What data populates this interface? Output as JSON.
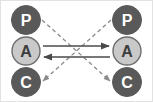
{
  "diagram": {
    "type": "node-link-diagram",
    "background_color": "#ffffff",
    "border_color": "#e2e2e2",
    "nodes": [
      {
        "id": "left-p",
        "label": "P",
        "column": "left",
        "row": "top",
        "cx": 26,
        "cy": 20,
        "r": 15,
        "fill_color": "#595959",
        "stroke_color": "#595959",
        "text_color": "#ffffff"
      },
      {
        "id": "left-a",
        "label": "A",
        "column": "left",
        "row": "middle",
        "cx": 26,
        "cy": 51,
        "r": 15,
        "fill_color": "#c9c9c9",
        "stroke_color": "#6e6e6e",
        "text_color": "#3d3d3d"
      },
      {
        "id": "left-c",
        "label": "C",
        "column": "left",
        "row": "bottom",
        "cx": 26,
        "cy": 82,
        "r": 15,
        "fill_color": "#595959",
        "stroke_color": "#595959",
        "text_color": "#ffffff"
      },
      {
        "id": "right-p",
        "label": "P",
        "column": "right",
        "row": "top",
        "cx": 127,
        "cy": 20,
        "r": 15,
        "fill_color": "#595959",
        "stroke_color": "#595959",
        "text_color": "#ffffff"
      },
      {
        "id": "right-a",
        "label": "A",
        "column": "right",
        "row": "middle",
        "cx": 127,
        "cy": 51,
        "r": 15,
        "fill_color": "#c9c9c9",
        "stroke_color": "#6e6e6e",
        "text_color": "#3d3d3d"
      },
      {
        "id": "right-c",
        "label": "C",
        "column": "right",
        "row": "bottom",
        "cx": 127,
        "cy": 82,
        "r": 15,
        "fill_color": "#595959",
        "stroke_color": "#595959",
        "text_color": "#ffffff"
      }
    ],
    "edges": [
      {
        "id": "edge-a-to-a-right",
        "style": "solid",
        "color": "#4a4a4a",
        "from": "left-a",
        "to": "right-a",
        "direction": "right",
        "x1": 43,
        "y1": 46,
        "x2": 110,
        "y2": 46
      },
      {
        "id": "edge-a-to-a-left",
        "style": "solid",
        "color": "#4a4a4a",
        "from": "right-a",
        "to": "left-a",
        "direction": "left",
        "x1": 110,
        "y1": 57,
        "x2": 43,
        "y2": 57
      },
      {
        "id": "edge-p-left-to-c-right",
        "style": "dashed",
        "color": "#8a8a8a",
        "from": "left-p",
        "to": "right-c",
        "direction": "down-right",
        "x1": 42,
        "y1": 20,
        "x2": 110,
        "y2": 81
      },
      {
        "id": "edge-p-right-to-c-left",
        "style": "dashed",
        "color": "#8a8a8a",
        "from": "right-p",
        "to": "left-c",
        "direction": "down-left",
        "x1": 111,
        "y1": 20,
        "x2": 43,
        "y2": 81
      }
    ],
    "legend_keys": {
      "P": "P",
      "A": "A",
      "C": "C"
    }
  }
}
